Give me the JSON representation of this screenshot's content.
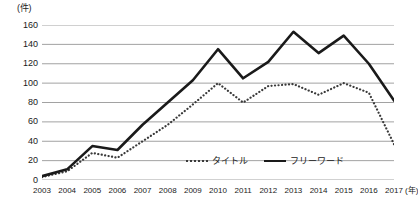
{
  "chart_data": {
    "type": "line",
    "title": "",
    "xlabel": "年",
    "ylabel": "件",
    "unit_label": "(件)",
    "x_unit_suffix": "(年)",
    "grid": true,
    "legend_position": "inside-bottom-center",
    "ylim": [
      0,
      160
    ],
    "ytick_values": [
      0,
      20,
      40,
      60,
      80,
      100,
      120,
      140,
      160
    ],
    "ytick_labels": [
      "0",
      "20",
      "40",
      "60",
      "80",
      "100",
      "120",
      "140",
      "160"
    ],
    "categories": [
      "2003",
      "2004",
      "2005",
      "2006",
      "2007",
      "2008",
      "2009",
      "2010",
      "2011",
      "2012",
      "2013",
      "2014",
      "2015",
      "2016",
      "2017"
    ],
    "series": [
      {
        "name": "タイトル",
        "style": "dotted",
        "color": "#3a3a3a",
        "values": [
          3,
          9,
          28,
          23,
          40,
          57,
          78,
          100,
          80,
          97,
          99,
          88,
          100,
          90,
          37
        ]
      },
      {
        "name": "フリーワード",
        "style": "solid",
        "color": "#1a1a1a",
        "values": [
          4,
          11,
          35,
          31,
          57,
          80,
          103,
          135,
          105,
          122,
          153,
          131,
          149,
          120,
          82
        ]
      }
    ]
  },
  "legend": {
    "items": [
      {
        "label": "タイトル",
        "style": "dotted"
      },
      {
        "label": "フリーワード",
        "style": "solid"
      }
    ]
  }
}
